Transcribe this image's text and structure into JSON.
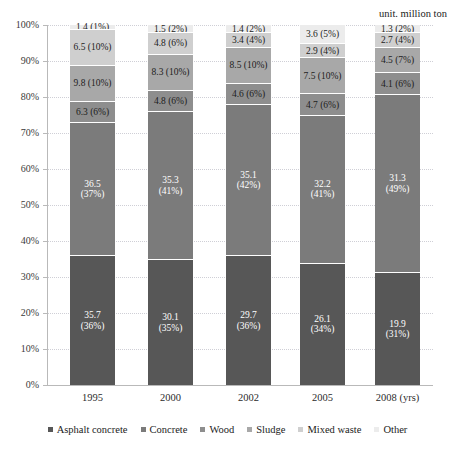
{
  "unit_note": "unit. million ton",
  "axis": {
    "y_ticks": [
      "100%",
      "90%",
      "80%",
      "70%",
      "60%",
      "50%",
      "40%",
      "30%",
      "20%",
      "10%",
      "0%"
    ],
    "x_unit_suffix": "(yrs)"
  },
  "legend": {
    "items": [
      {
        "label": "Asphalt concrete",
        "color": "#575757"
      },
      {
        "label": "Concrete",
        "color": "#7b7b7b"
      },
      {
        "label": "Wood",
        "color": "#8e8e8e"
      },
      {
        "label": "Sludge",
        "color": "#a8a8a8"
      },
      {
        "label": "Mixed waste",
        "color": "#cfcfcf"
      },
      {
        "label": "Other",
        "color": "#ececec"
      }
    ]
  },
  "chart_data": {
    "type": "bar",
    "title": "",
    "subtitle": "",
    "xlabel": "(yrs)",
    "ylabel": "",
    "ylim": [
      0,
      100
    ],
    "grid": true,
    "stacked": true,
    "normalized_percent": true,
    "legend_position": "bottom",
    "unit": "million ton",
    "categories": [
      "1995",
      "2000",
      "2002",
      "2005",
      "2008"
    ],
    "series": [
      {
        "name": "Asphalt concrete",
        "color": "#575757",
        "values": [
          35.7,
          30.1,
          29.7,
          26.1,
          19.9
        ],
        "percents": [
          36,
          35,
          36,
          34,
          31
        ],
        "labels": [
          "35.7\n(36%)",
          "30.1\n(35%)",
          "29.7\n(36%)",
          "26.1\n(34%)",
          "19.9\n(31%)"
        ]
      },
      {
        "name": "Concrete",
        "color": "#7b7b7b",
        "values": [
          36.5,
          35.3,
          35.1,
          32.2,
          31.3
        ],
        "percents": [
          37,
          41,
          42,
          41,
          49
        ],
        "labels": [
          "36.5\n(37%)",
          "35.3\n(41%)",
          "35.1\n(42%)",
          "32.2\n(41%)",
          "31.3\n(49%)"
        ]
      },
      {
        "name": "Wood",
        "color": "#8e8e8e",
        "values": [
          6.3,
          4.8,
          4.6,
          4.7,
          4.1
        ],
        "percents": [
          6,
          6,
          6,
          6,
          6
        ],
        "labels": [
          "6.3 (6%)",
          "4.8 (6%)",
          "4.6 (6%)",
          "4.7 (6%)",
          "4.1 (6%)"
        ]
      },
      {
        "name": "Sludge",
        "color": "#a8a8a8",
        "values": [
          9.8,
          8.3,
          8.5,
          7.5,
          4.5
        ],
        "percents": [
          10,
          10,
          10,
          10,
          7
        ],
        "labels": [
          "9.8 (10%)",
          "8.3 (10%)",
          "8.5 (10%)",
          "7.5 (10%)",
          "4.5 (7%)"
        ]
      },
      {
        "name": "Mixed waste",
        "color": "#cfcfcf",
        "values": [
          6.5,
          4.8,
          3.4,
          2.9,
          2.7
        ],
        "percents": [
          10,
          6,
          4,
          4,
          4
        ],
        "labels": [
          "6.5 (10%)",
          "4.8 (6%)",
          "3.4 (4%)",
          "2.9 (4%)",
          "2.7 (4%)"
        ]
      },
      {
        "name": "Other",
        "color": "#ececec",
        "values": [
          1.4,
          1.5,
          1.4,
          3.6,
          1.3
        ],
        "percents": [
          1,
          2,
          2,
          5,
          2
        ],
        "labels": [
          "1.4 (1%)",
          "1.5 (2%)",
          "1.4 (2%)",
          "3.6 (5%)",
          "1.3 (2%)"
        ]
      }
    ]
  }
}
